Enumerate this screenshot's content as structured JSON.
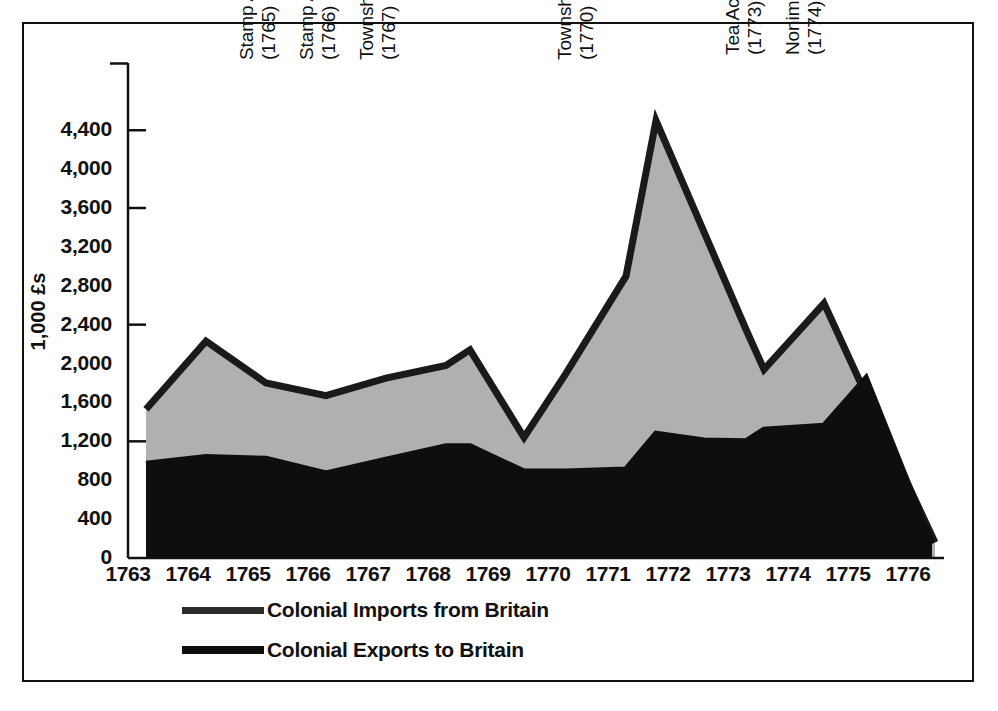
{
  "figure": {
    "background_color": "#ffffff",
    "frame_color": "#111111"
  },
  "chart_data": {
    "type": "area",
    "title": "",
    "subtitle": "",
    "xlabel": "",
    "ylabel": "1,000 £s",
    "xlim": [
      1763,
      1776.6
    ],
    "ylim": [
      0,
      4700
    ],
    "grid": false,
    "legend_position": "bottom-left",
    "xticks": [
      "1763",
      "1764",
      "1765",
      "1766",
      "1767",
      "1768",
      "1769",
      "1770",
      "1771",
      "1772",
      "1773",
      "1774",
      "1775",
      "1776"
    ],
    "yticks": [
      "0",
      "400",
      "800",
      "1,200",
      "1,600",
      "2,000",
      "2,400",
      "2,800",
      "3,200",
      "3,600",
      "4,000",
      "4,400"
    ],
    "ytick_values": [
      0,
      400,
      800,
      1200,
      1600,
      2000,
      2400,
      2800,
      3200,
      3600,
      4000,
      4400
    ],
    "axis_tick_marks_at": [
      1200,
      2400,
      3600,
      4400
    ],
    "stacking": "overlaid",
    "series": [
      {
        "name": "Colonial Imports from Britain",
        "fill_color": "#b0b0b0",
        "line_color": "#1a1a1a",
        "x": [
          1763.3,
          1764.3,
          1765.3,
          1766.3,
          1767.3,
          1768.3,
          1768.7,
          1769.6,
          1770.3,
          1771.3,
          1771.8,
          1773.3,
          1773.6,
          1774.6,
          1775.3
        ],
        "values": [
          1530,
          2230,
          1800,
          1670,
          1850,
          1980,
          2140,
          1240,
          1900,
          2900,
          4500,
          2350,
          1940,
          2620,
          1680
        ]
      },
      {
        "name": "Colonial Exports to Britain",
        "fill_color": "#0e0e0e",
        "line_color": "#0e0e0e",
        "x": [
          1763.3,
          1764.3,
          1765.3,
          1766.3,
          1767.3,
          1768.3,
          1768.7,
          1769.6,
          1770.3,
          1771.3,
          1771.8,
          1772.6,
          1773.3,
          1773.6,
          1774.6,
          1775.3,
          1776.4
        ],
        "values": [
          970,
          1040,
          1020,
          870,
          1010,
          1150,
          1150,
          890,
          890,
          910,
          1280,
          1210,
          1200,
          1320,
          1360,
          1850,
          150
        ]
      }
    ],
    "annotations": [
      {
        "id": "stamp-act-passed",
        "line1": "Stamp Act Passed",
        "line2": "(1765)",
        "x_year": 1765.0
      },
      {
        "id": "stamp-act-repealed",
        "line1": "Stamp Act Repealed",
        "line2": "(1766)",
        "x_year": 1766.0
      },
      {
        "id": "townshend-act-passed",
        "line1": "Townshend Act Passed",
        "line2": "(1767)",
        "x_year": 1767.0
      },
      {
        "id": "townshend-act-repealed",
        "line1": "Townshend Act Repealed",
        "line2": "(1770)",
        "x_year": 1770.3
      },
      {
        "id": "tea-act-passed",
        "line1": "Tea Act Passed",
        "line2": "(1773)",
        "x_year": 1773.1
      },
      {
        "id": "nonimportation-agreements",
        "line1": "Nonimportation Agreements",
        "line2": "(1774)",
        "x_year": 1774.1
      }
    ]
  },
  "annotation_labels": {
    "a0_l1": "Stamp Act Passed",
    "a0_l2": "(1765)",
    "a1_l1": "Stamp Act Repealed",
    "a1_l2": "(1766)",
    "a2_l1": "Townshend Act Passed",
    "a2_l2": "(1767)",
    "a3_l1": "Townshend Act Repealed",
    "a3_l2": "(1770)",
    "a4_l1": "Tea Act Passed",
    "a4_l2": "(1773)",
    "a5_l1": "Nonimportation Agreements",
    "a5_l2": "(1774)"
  },
  "yaxis": {
    "title": "1,000 £s",
    "labels": [
      "4,400",
      "4,000",
      "3,600",
      "3,200",
      "2,800",
      "2,400",
      "2,000",
      "1,600",
      "1,200",
      "800",
      "400",
      "0"
    ]
  },
  "xaxis": {
    "labels": [
      "1763",
      "1764",
      "1765",
      "1766",
      "1767",
      "1768",
      "1769",
      "1770",
      "1771",
      "1772",
      "1773",
      "1774",
      "1775",
      "1776"
    ]
  },
  "legend": {
    "items": [
      {
        "label": "Colonial Imports from Britain",
        "color": "#2b2b2b"
      },
      {
        "label": "Colonial Exports to Britain",
        "color": "#0e0e0e"
      }
    ],
    "item0_label": "Colonial Imports from Britain",
    "item1_label": "Colonial Exports to Britain"
  }
}
